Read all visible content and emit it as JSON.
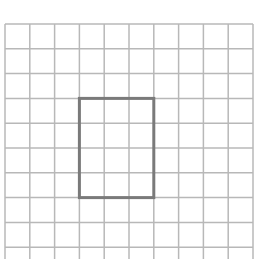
{
  "diagram": {
    "type": "grid-with-rectangle",
    "grid": {
      "columns": 10,
      "rows_visible": 10,
      "origin_x": 5,
      "origin_y": 24,
      "cell_size": 24.8,
      "line_color": "#b8b8b8",
      "bottom_cut_off": true
    },
    "rectangle": {
      "col_start": 3,
      "row_start": 3,
      "width_cells": 3,
      "height_cells": 4,
      "stroke_color": "#7a7a7a",
      "stroke_width": 3
    }
  }
}
